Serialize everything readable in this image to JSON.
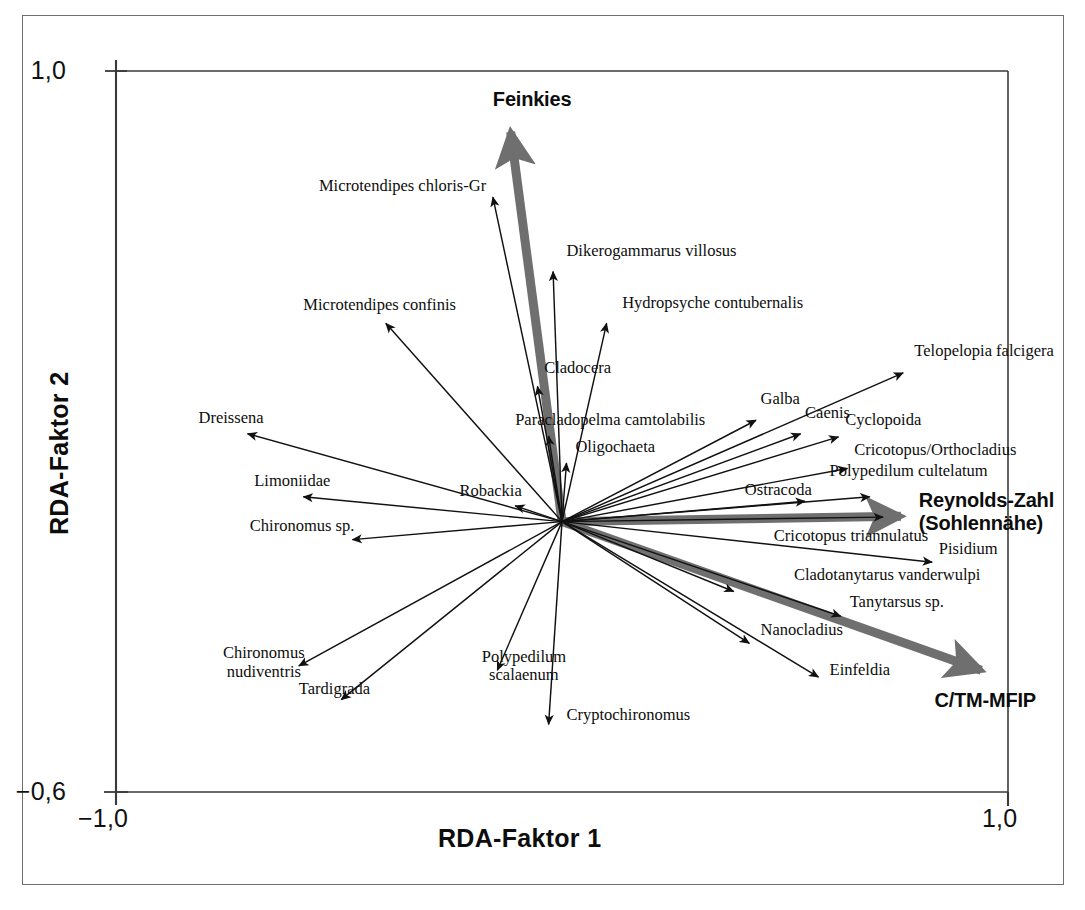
{
  "figure": {
    "type": "rda-ordination-biplot",
    "background": "#ffffff",
    "frame_color": "#6e6e6e",
    "axis_color": "#3a3a3a",
    "species_arrow_color": "#111111",
    "env_arrow_color": "#6f6f6f"
  },
  "axes": {
    "x_title": "RDA-Faktor 1",
    "y_title": "RDA-Faktor 2",
    "x_min_label": "−1,0",
    "x_max_label": "1,0",
    "y_min_label": "−0,6",
    "y_max_label": "1,0"
  },
  "chart_data": {
    "type": "scatter",
    "title": "",
    "subtitle": "",
    "xlabel": "RDA-Faktor 1",
    "ylabel": "RDA-Faktor 2",
    "xlim": [
      -1.0,
      1.0
    ],
    "ylim": [
      -0.6,
      1.0
    ],
    "xticks": [
      -1.0,
      1.0
    ],
    "xticklabels": [
      "−1,0",
      "1,0"
    ],
    "yticks": [
      -0.6,
      1.0
    ],
    "yticklabels": [
      "−0,6",
      "1,0"
    ],
    "grid": false,
    "legend": "none",
    "origin": [
      0.0,
      0.0
    ],
    "environment_vectors": [
      {
        "name": "Feinkies",
        "x": -0.115,
        "y": 0.865,
        "label_x": -0.155,
        "label_y": 0.935
      },
      {
        "name": "Reynolds-Zahl\n(Sohlennähe)",
        "x": 0.76,
        "y": 0.012,
        "label_x": 0.8,
        "label_y": 0.045
      },
      {
        "name": "C/TM-MFIP",
        "x": 0.94,
        "y": -0.33,
        "label_x": 0.835,
        "label_y": -0.398
      }
    ],
    "species_vectors": [
      {
        "name": "Microtendipes chloris-Gr",
        "x": -0.155,
        "y": 0.72,
        "label_x": -0.545,
        "label_y": 0.745
      },
      {
        "name": "Dikerogammarus villosus",
        "x": -0.02,
        "y": 0.555,
        "label_x": 0.01,
        "label_y": 0.6
      },
      {
        "name": "Hydropsyche contubernalis",
        "x": 0.1,
        "y": 0.44,
        "label_x": 0.135,
        "label_y": 0.485
      },
      {
        "name": "Microtendipes confinis",
        "x": -0.395,
        "y": 0.44,
        "label_x": -0.58,
        "label_y": 0.48
      },
      {
        "name": "Telopelopia falcigera",
        "x": 0.765,
        "y": 0.33,
        "label_x": 0.79,
        "label_y": 0.378
      },
      {
        "name": "Cladocera",
        "x": -0.055,
        "y": 0.3,
        "label_x": -0.04,
        "label_y": 0.34
      },
      {
        "name": "Galba",
        "x": 0.435,
        "y": 0.225,
        "label_x": 0.445,
        "label_y": 0.272
      },
      {
        "name": "Caenis",
        "x": 0.535,
        "y": 0.195,
        "label_x": 0.545,
        "label_y": 0.24
      },
      {
        "name": "Cyclopoida",
        "x": 0.62,
        "y": 0.188,
        "label_x": 0.635,
        "label_y": 0.226
      },
      {
        "name": "Dreissena",
        "x": -0.705,
        "y": 0.195,
        "label_x": -0.815,
        "label_y": 0.23
      },
      {
        "name": "Paracladopelma camtolabilis",
        "x": -0.03,
        "y": 0.19,
        "label_x": -0.105,
        "label_y": 0.226
      },
      {
        "name": "Cricotopus/Orthocladius",
        "x": 0.64,
        "y": 0.118,
        "label_x": 0.655,
        "label_y": 0.16
      },
      {
        "name": "Oligochaeta",
        "x": 0.01,
        "y": 0.13,
        "label_x": 0.03,
        "label_y": 0.165
      },
      {
        "name": "Polypedilum cultelatum",
        "x": 0.69,
        "y": 0.055,
        "label_x": 0.6,
        "label_y": 0.112
      },
      {
        "name": "Limoniidae",
        "x": -0.58,
        "y": 0.055,
        "label_x": -0.69,
        "label_y": 0.09
      },
      {
        "name": "Robackia",
        "x": -0.105,
        "y": 0.035,
        "label_x": -0.23,
        "label_y": 0.068
      },
      {
        "name": "Ostracoda",
        "x": 0.545,
        "y": 0.045,
        "label_x": 0.41,
        "label_y": 0.07
      },
      {
        "name": "Cricotopus triannulatus",
        "x": 0.72,
        "y": 0.01,
        "label_x": 0.475,
        "label_y": -0.032
      },
      {
        "name": "Chironomus sp.",
        "x": -0.47,
        "y": -0.04,
        "label_x": -0.7,
        "label_y": -0.01
      },
      {
        "name": "Pisidium",
        "x": 0.83,
        "y": -0.09,
        "label_x": 0.845,
        "label_y": -0.06
      },
      {
        "name": "Cladotanytarus vanderwulpi",
        "x": 0.385,
        "y": -0.155,
        "label_x": 0.52,
        "label_y": -0.118
      },
      {
        "name": "Tanytarsus sp.",
        "x": 0.625,
        "y": -0.21,
        "label_x": 0.645,
        "label_y": -0.178
      },
      {
        "name": "Nanocladius",
        "x": 0.42,
        "y": -0.27,
        "label_x": 0.445,
        "label_y": -0.24
      },
      {
        "name": "Chironomus nudiventris",
        "x": -0.59,
        "y": -0.32,
        "label_x": -0.76,
        "label_y": -0.292
      },
      {
        "name": "Einfeldia",
        "x": 0.575,
        "y": -0.345,
        "label_x": 0.6,
        "label_y": -0.33
      },
      {
        "name": "Polypedilum scalaenum",
        "x": -0.145,
        "y": -0.33,
        "label_x": -0.18,
        "label_y": -0.3
      },
      {
        "name": "Tardigrada",
        "x": -0.495,
        "y": -0.395,
        "label_x": -0.59,
        "label_y": -0.372
      },
      {
        "name": "Cryptochironomus",
        "x": -0.03,
        "y": -0.45,
        "label_x": 0.01,
        "label_y": -0.43
      }
    ]
  },
  "labels": {
    "feinkies": "Feinkies",
    "reynolds": "Reynolds-Zahl\n(Sohlennähe)",
    "ctm": "C/TM-MFIP",
    "microtendipes_chloris": "Microtendipes chloris-Gr",
    "dikerogammarus": "Dikerogammarus villosus",
    "hydropsyche": "Hydropsyche contubernalis",
    "microtendipes_confinis": "Microtendipes confinis",
    "telopelopia": "Telopelopia falcigera",
    "cladocera": "Cladocera",
    "galba": "Galba",
    "caenis": "Caenis",
    "cyclopoida": "Cyclopoida",
    "dreissena": "Dreissena",
    "paracladopelma": "Paracladopelma camtolabilis",
    "cricotopus_ortho": "Cricotopus/Orthocladius",
    "oligochaeta": "Oligochaeta",
    "polypedilum_cultelatum": "Polypedilum cultelatum",
    "limoniidae": "Limoniidae",
    "robackia": "Robackia",
    "ostracoda": "Ostracoda",
    "cricotopus_tri": "Cricotopus triannulatus",
    "chironomus_sp": "Chironomus sp.",
    "pisidium": "Pisidium",
    "cladotanytarus": "Cladotanytarus vanderwulpi",
    "tanytarsus": "Tanytarsus sp.",
    "nanocladius": "Nanocladius",
    "chironomus_nudiventris": "Chironomus\nnudiventris",
    "einfeldia": "Einfeldia",
    "polypedilum_scalaenum": "Polypedilum\nscalaenum",
    "tardigrada": "Tardigrada",
    "cryptochironomus": "Cryptochironomus"
  }
}
